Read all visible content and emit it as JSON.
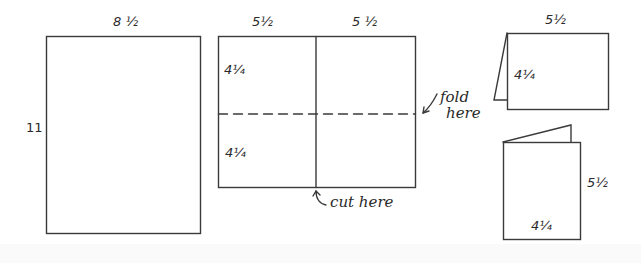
{
  "diagram": {
    "type": "paper folding instructions",
    "stroke_color": "#3a3a3a",
    "sheet": {
      "width_label": "8 ½",
      "height_label": "11"
    },
    "cut_sheet": {
      "left_width_label": "5½",
      "right_width_label": "5 ½",
      "top_height_label": "4¼",
      "bottom_height_label": "4¼",
      "fold_annotation": "fold\nhere",
      "fold_line_1": "fold",
      "fold_line_2": "here",
      "cut_annotation": "cut here"
    },
    "tent_card": {
      "width_label": "5½",
      "height_label": "4¼"
    },
    "booklet_card": {
      "height_label": "5½",
      "width_label": "4¼"
    }
  }
}
